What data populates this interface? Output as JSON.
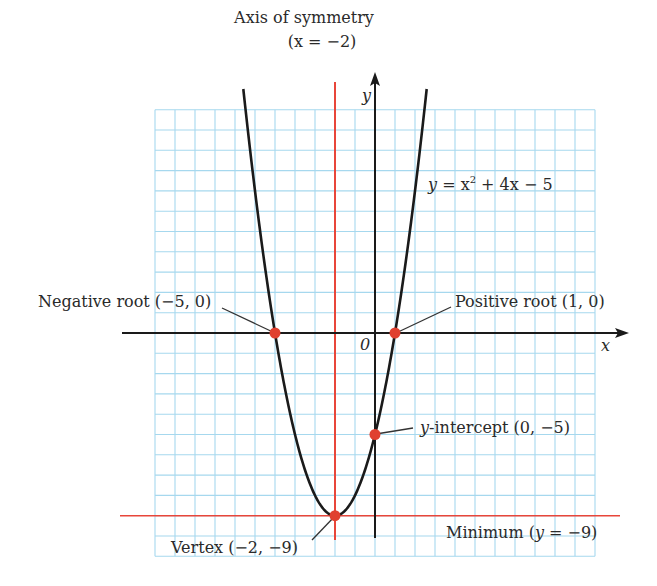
{
  "chart_data": {
    "type": "line",
    "title": "",
    "equation": "y = x² + 4x − 5",
    "function": {
      "a": 1,
      "b": 4,
      "c": -5
    },
    "xlabel": "x",
    "ylabel": "y",
    "origin_label": "0",
    "xlim": [
      -11,
      11
    ],
    "ylim": [
      -11,
      11
    ],
    "grid": true,
    "axis_of_symmetry": {
      "x": -2,
      "label_line1": "Axis of symmetry",
      "label_line2": "(x = −2)"
    },
    "minimum_line": {
      "y": -9,
      "label": "Minimum (y = −9)"
    },
    "points": [
      {
        "name": "negative-root",
        "x": -5,
        "y": 0,
        "label": "Negative root (−5, 0)"
      },
      {
        "name": "positive-root",
        "x": 1,
        "y": 0,
        "label": "Positive root (1, 0)"
      },
      {
        "name": "y-intercept",
        "x": 0,
        "y": -5,
        "label": "y-intercept (0, −5)"
      },
      {
        "name": "vertex",
        "x": -2,
        "y": -9,
        "label": "Vertex (−2, −9)"
      }
    ]
  },
  "labels": {
    "axis_sym_1": "Axis of symmetry",
    "axis_sym_2": "(x = −2)",
    "equation_y": "y",
    "equation_rest": " = x",
    "equation_sup": "2",
    "equation_tail": " + 4x − 5",
    "neg_root": "Negative root (−5, 0)",
    "pos_root": "Positive root (1, 0)",
    "y_int_y": "y",
    "y_int_rest": "-intercept (0, −5)",
    "vertex": "Vertex (−2, −9)",
    "minimum_pre": "Minimum (",
    "minimum_y": "y",
    "minimum_post": " = −9)",
    "x_axis": "x",
    "y_axis": "y",
    "origin": "0"
  },
  "colors": {
    "grid": "#a6d8ee",
    "curve": "#1a1a1a",
    "axis": "#1a1a1a",
    "accent_red": "#e8463a",
    "point": "#e0402f"
  }
}
